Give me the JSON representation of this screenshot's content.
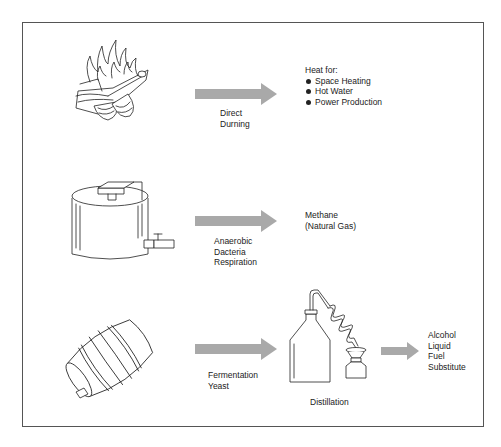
{
  "diagram": {
    "type": "process-flow",
    "title": "",
    "colors": {
      "arrow": "#a9a9a9",
      "border": "#555555",
      "line": "#222222"
    },
    "rows": [
      {
        "source_icon": "campfire-icon",
        "process_label": [
          "Direct",
          "Durning"
        ],
        "output_title": "Heat for:",
        "output_items": [
          "Space Heating",
          "Hot Water",
          "Power Production"
        ]
      },
      {
        "source_icon": "tank-icon",
        "process_label": [
          "Anaerobic",
          "Dacteria",
          "Respiration"
        ],
        "output_lines": [
          "Methane",
          "(Natural Gas)"
        ]
      },
      {
        "source_icon": "barrel-icon",
        "process_label": [
          "Fermentation",
          "Yeast"
        ],
        "intermediate_icon": "distillation-apparatus-icon",
        "intermediate_label": "Distillation",
        "output_lines": [
          "Alcohol",
          "Liquid",
          "Fuel",
          "Substitute"
        ]
      }
    ]
  }
}
